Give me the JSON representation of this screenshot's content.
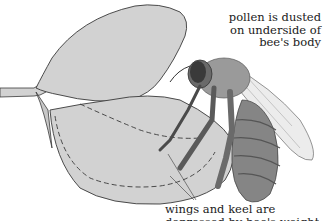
{
  "diagram": {
    "labels": {
      "pollen": [
        "pollen is dusted",
        "on underside of",
        "bee's body"
      ],
      "wings_keel": [
        "wings and keel are",
        "depressed by bee's weight"
      ]
    },
    "colors": {
      "petal_fill": "#d2d2d2",
      "outline": "#3a3a3a",
      "bee_body": "#8a8a8a",
      "bee_dark": "#4a4a4a",
      "wing": "#ececec",
      "background": "#ffffff"
    }
  }
}
